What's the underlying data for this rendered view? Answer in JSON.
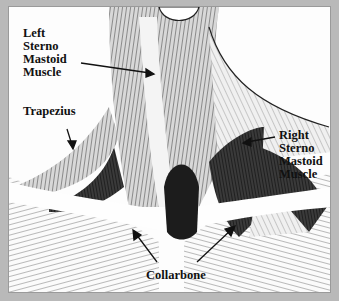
{
  "figure": {
    "frame_color": "#b9b9b9",
    "background_color": "#fdfdfd",
    "ink_color": "#111111"
  },
  "labels": {
    "left_scm": "Left\nSterno\nMastoid\nMuscle",
    "trapezius": "Trapezius",
    "right_scm": "Right\nSterno\nMastoid\nMuscle",
    "collarbone": "Collarbone"
  }
}
